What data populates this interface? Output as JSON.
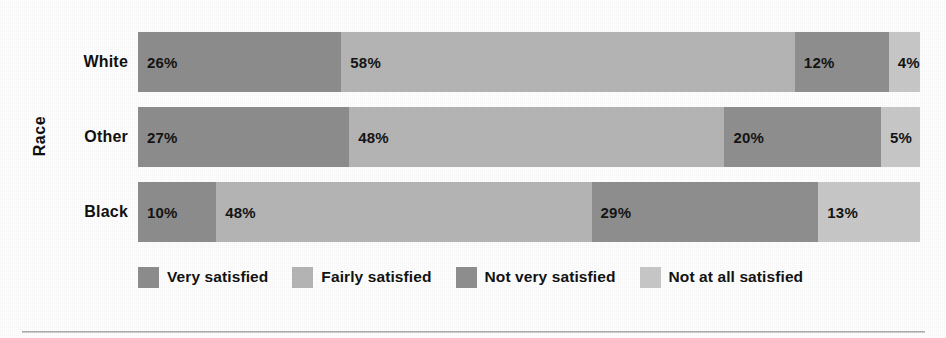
{
  "chart_data": {
    "type": "bar",
    "subtype": "stacked-horizontal-100",
    "title": "",
    "xlabel": "",
    "ylabel": "Race",
    "categories": [
      "White",
      "Other",
      "Black"
    ],
    "series": [
      {
        "name": "Very satisfied",
        "color": "#8e8e8e",
        "values": [
          26,
          58,
          10
        ]
      },
      {
        "name": "Fairly satisfied",
        "color": "#b6b6b6",
        "values": [
          58,
          48,
          48
        ]
      },
      {
        "name": "Not very satisfied",
        "color": "#909090",
        "values": [
          12,
          20,
          29
        ]
      },
      {
        "name": "Not at all satisfied",
        "color": "#c9c9c9",
        "values": [
          4,
          5,
          13
        ]
      }
    ],
    "rows": [
      {
        "category": "White",
        "segments": [
          {
            "name": "Very satisfied",
            "value": 26,
            "label": "26%",
            "color": "#8e8e8e"
          },
          {
            "name": "Fairly satisfied",
            "value": 58,
            "label": "58%",
            "color": "#b6b6b6"
          },
          {
            "name": "Not very satisfied",
            "value": 12,
            "label": "12%",
            "color": "#909090"
          },
          {
            "name": "Not at all satisfied",
            "value": 4,
            "label": "4%",
            "color": "#c9c9c9"
          }
        ]
      },
      {
        "category": "Other",
        "segments": [
          {
            "name": "Very satisfied",
            "value": 27,
            "label": "27%",
            "color": "#8e8e8e"
          },
          {
            "name": "Fairly satisfied",
            "value": 48,
            "label": "48%",
            "color": "#b6b6b6"
          },
          {
            "name": "Not very satisfied",
            "value": 20,
            "label": "20%",
            "color": "#909090"
          },
          {
            "name": "Not at all satisfied",
            "value": 5,
            "label": "5%",
            "color": "#c9c9c9"
          }
        ]
      },
      {
        "category": "Black",
        "segments": [
          {
            "name": "Very satisfied",
            "value": 10,
            "label": "10%",
            "color": "#8e8e8e"
          },
          {
            "name": "Fairly satisfied",
            "value": 48,
            "label": "48%",
            "color": "#b6b6b6"
          },
          {
            "name": "Not very satisfied",
            "value": 29,
            "label": "29%",
            "color": "#909090"
          },
          {
            "name": "Not at all satisfied",
            "value": 13,
            "label": "13%",
            "color": "#c9c9c9"
          }
        ]
      }
    ],
    "legend": {
      "position": "bottom",
      "entries": [
        {
          "label": "Very satisfied",
          "color": "#8e8e8e"
        },
        {
          "label": "Fairly satisfied",
          "color": "#b6b6b6"
        },
        {
          "label": "Not very satisfied",
          "color": "#909090"
        },
        {
          "label": "Not at all satisfied",
          "color": "#c9c9c9"
        }
      ]
    },
    "xlim": [
      0,
      100
    ],
    "grid": false,
    "value_labels": true
  },
  "axis": {
    "category_axis_title": "Race"
  }
}
